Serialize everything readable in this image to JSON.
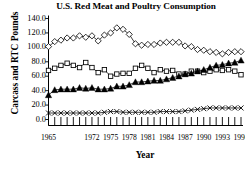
{
  "chart_data": {
    "type": "line",
    "title": "U.S. Red Meat and Poultry Consumption",
    "xlabel": "Year",
    "ylabel": "Carcass and RTC Pounds",
    "xlim": [
      1965,
      1996
    ],
    "ylim": [
      0.0,
      140.0
    ],
    "grid": false,
    "legend": "none",
    "ytick_labels": [
      "140.0",
      "120.0",
      "100.0",
      "80.0",
      "60.0",
      "40.0",
      "20.0",
      "0.0"
    ],
    "ytick_values": [
      140.0,
      120.0,
      100.0,
      80.0,
      60.0,
      40.0,
      20.0,
      0.0
    ],
    "xtick_labels": [
      "1965",
      "1972",
      "1975",
      "1978",
      "1981",
      "1984",
      "1987",
      "1990",
      "1993",
      "1996"
    ],
    "xtick_values": [
      1965,
      1972,
      1975,
      1978,
      1981,
      1984,
      1987,
      1990,
      1993,
      1996
    ],
    "x": [
      1965,
      1966,
      1967,
      1968,
      1969,
      1970,
      1971,
      1972,
      1973,
      1974,
      1975,
      1976,
      1977,
      1978,
      1979,
      1980,
      1981,
      1982,
      1983,
      1984,
      1985,
      1986,
      1987,
      1988,
      1989,
      1990,
      1991,
      1992,
      1993,
      1994,
      1995,
      1996
    ],
    "series": [
      {
        "name": "Beef",
        "marker": "open-diamond",
        "color": "#000000",
        "values": [
          101.0,
          108.0,
          110.0,
          113.0,
          113.0,
          116.0,
          114.0,
          116.0,
          109.0,
          117.0,
          120.0,
          127.0,
          125.0,
          118.0,
          105.0,
          103.0,
          104.0,
          104.0,
          106.0,
          107.0,
          107.0,
          107.0,
          102.0,
          101.0,
          97.0,
          96.0,
          94.0,
          93.0,
          91.0,
          93.0,
          94.0,
          94.0
        ]
      },
      {
        "name": "Pork",
        "marker": "open-square",
        "color": "#000000",
        "values": [
          68.0,
          71.0,
          75.0,
          78.0,
          75.0,
          72.0,
          79.0,
          72.0,
          65.0,
          69.0,
          60.0,
          63.0,
          64.0,
          64.0,
          71.0,
          75.0,
          71.0,
          65.0,
          69.0,
          67.0,
          68.0,
          63.0,
          63.0,
          67.0,
          67.0,
          65.0,
          67.0,
          69.0,
          68.0,
          69.0,
          67.0,
          62.0
        ]
      },
      {
        "name": "Poultry",
        "marker": "filled-triangle",
        "color": "#000000",
        "values": [
          34.0,
          41.0,
          42.0,
          42.0,
          42.0,
          44.0,
          43.0,
          44.0,
          42.0,
          42.0,
          43.0,
          46.0,
          46.0,
          48.0,
          52.0,
          52.0,
          53.0,
          54.0,
          54.0,
          56.0,
          58.0,
          60.0,
          63.0,
          64.0,
          67.0,
          69.0,
          72.0,
          75.0,
          76.0,
          78.0,
          79.0,
          82.0
        ]
      },
      {
        "name": "Lamb and Veal",
        "marker": "cross-x",
        "color": "#000000",
        "values": [
          9.0,
          9.0,
          9.0,
          9.0,
          9.0,
          9.0,
          9.0,
          9.0,
          9.0,
          10.0,
          11.0,
          11.0,
          10.0,
          10.0,
          10.0,
          10.0,
          10.0,
          10.0,
          11.0,
          11.0,
          11.0,
          11.0,
          12.0,
          13.0,
          14.0,
          15.0,
          16.0,
          16.0,
          16.0,
          16.0,
          16.0,
          16.0
        ]
      }
    ]
  }
}
